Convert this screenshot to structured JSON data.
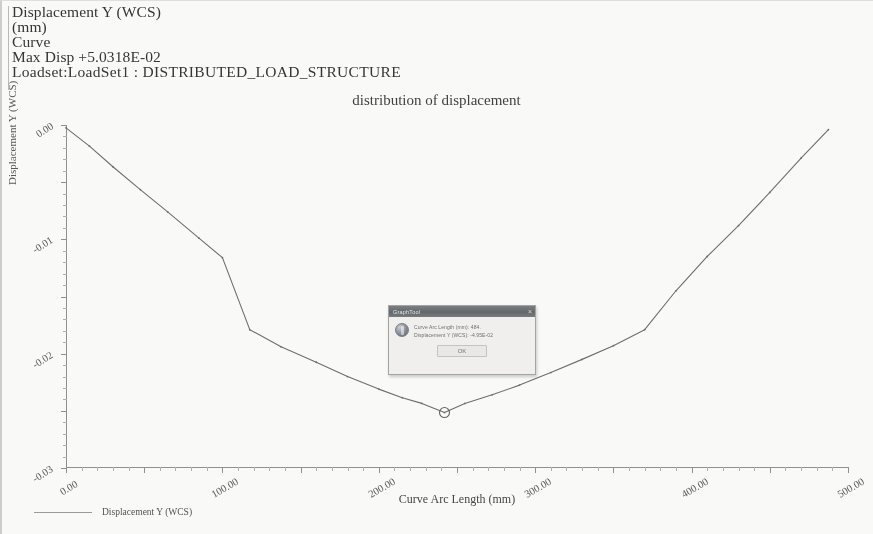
{
  "header": {
    "lines": [
      "Displacement Y (WCS)",
      "(mm)",
      "Curve",
      "Max Disp  +5.0318E-02",
      "Loadset:LoadSet1 :  DISTRIBUTED_LOAD_STRUCTURE"
    ]
  },
  "legend": {
    "label": "Displacement Y (WCS)"
  },
  "dialog": {
    "title": "GraphTool",
    "icon": "info-icon",
    "close_label": "×",
    "message_lines": [
      "Curve Arc Length (mm): 484.",
      "Displacement Y (WCS): -4.95E-02"
    ],
    "ok_label": "OK"
  },
  "chart_data": {
    "type": "line",
    "title": "distribution of displacement",
    "xlabel": "Curve Arc Length (mm)",
    "ylabel": "Displacement Y (WCS)",
    "xlim": [
      0,
      1000
    ],
    "ylim": [
      -0.06,
      0.0
    ],
    "xticks": [
      0,
      100,
      200,
      300,
      400,
      500,
      600,
      700,
      800,
      900,
      1000
    ],
    "xtick_labels": [
      "0.00",
      "100.00",
      "200.00",
      "300.00",
      "400.00",
      "500.00",
      "600.00",
      "700.00",
      "800.00",
      "900.00",
      "1000.00"
    ],
    "yticks": [
      0.0,
      -0.01,
      -0.02,
      -0.03,
      -0.04,
      -0.05,
      -0.06
    ],
    "ytick_labels": [
      "0.00",
      "-0.01",
      "-0.02",
      "-0.03",
      "-0.04",
      "-0.05",
      "-0.06"
    ],
    "grid": false,
    "legend_position": "bottom-left",
    "series": [
      {
        "name": "Displacement Y (WCS)",
        "color": "#6a6a6a",
        "x": [
          0,
          30,
          60,
          95,
          130,
          170,
          200,
          235,
          275,
          320,
          360,
          400,
          430,
          455,
          484,
          510,
          545,
          580,
          620,
          660,
          700,
          740,
          780,
          820,
          860,
          900,
          940,
          975
        ],
        "y": [
          -0.0005,
          -0.0037,
          -0.0073,
          -0.0113,
          -0.0152,
          -0.0198,
          -0.0232,
          -0.0358,
          -0.0388,
          -0.0415,
          -0.044,
          -0.0462,
          -0.0477,
          -0.0487,
          -0.0503,
          -0.0487,
          -0.0472,
          -0.0455,
          -0.0433,
          -0.041,
          -0.0386,
          -0.0358,
          -0.029,
          -0.023,
          -0.0176,
          -0.0118,
          -0.0058,
          -0.0008
        ]
      }
    ],
    "markers": [
      {
        "name": "selected-point",
        "x": 484,
        "y": -0.0503,
        "shape": "circle"
      }
    ],
    "annotations": {
      "max_disp": "Max Disp  +5.0318E-02"
    }
  }
}
